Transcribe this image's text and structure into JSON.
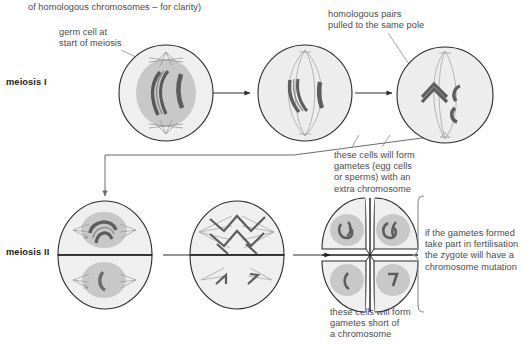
{
  "figure": {
    "title_fragment": "of homologous chromosomes – for clarity)",
    "type": "biology-diagram"
  },
  "stage_labels": {
    "meiosis_i": "meiosis I",
    "meiosis_ii": "meiosis II"
  },
  "annotations": {
    "germ_cell": "germ cell at\nstart of meiosis",
    "homologous_pairs": "homologous pairs\npulled to the same pole",
    "extra_chromosome": "these cells will form\ngametes (egg cells\nor sperms) with an\nextra chromosome",
    "short_chromosome": "these cells will form\ngametes short of\na chromosome",
    "zygote_outcome": "if the gametes formed\ntake part in fertilisation\nthe zygote will have a\nchromosome mutation"
  },
  "cells": [
    {
      "id": "cell-1",
      "stage": "meiosis I",
      "description": "germ cell, intact nucleus with homologous pair and single chromosome"
    },
    {
      "id": "cell-2",
      "stage": "meiosis I",
      "description": "spindle formed, chromosomes at metaphase plate"
    },
    {
      "id": "cell-3",
      "stage": "meiosis I",
      "description": "homologous pair pulled to same pole, non-disjunction"
    },
    {
      "id": "cell-4",
      "stage": "meiosis II",
      "description": "two daughter cells, upper with three chromatids, lower with one"
    },
    {
      "id": "cell-5",
      "stage": "meiosis II",
      "description": "two daughter cells with spindles at metaphase"
    },
    {
      "id": "cell-6",
      "stage": "meiosis II",
      "description": "four gametes: two with extra chromosome, two short of a chromosome"
    }
  ],
  "colors": {
    "cell_outline": "#2b2b2b",
    "cytoplasm": "#eeeeee",
    "nucleus": "#c2c2c2",
    "chromosome": "#6f6f6f",
    "chromosome_dark": "#555555",
    "spindle": "#9a9a9a",
    "text": "#4a4a4a",
    "label": "#1d1d1d",
    "leader": "#8a8a8a",
    "connector": "#6b6b6b",
    "background": "#ffffff"
  }
}
